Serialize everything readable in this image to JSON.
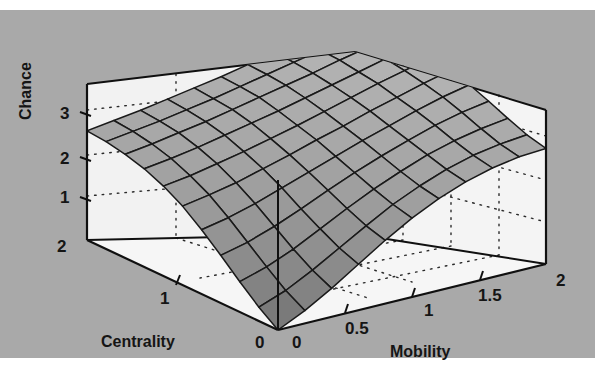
{
  "figure": {
    "background_color": "#a9a9a9",
    "page_color": "#ffffff",
    "line_color": "#151515",
    "surface_fill_light": "#b4b4b4",
    "surface_fill_dark": "#6e6e6e",
    "wall_color": "#f2f2f2"
  },
  "chart_data": {
    "type": "surface",
    "title": "",
    "xlabel": "Mobility",
    "ylabel": "Centrality",
    "zlabel": "Chance",
    "grid": true,
    "legend": null,
    "xlim": [
      0,
      2
    ],
    "ylim": [
      0,
      2
    ],
    "zlim": [
      0,
      3.4
    ],
    "xticks": [
      "0",
      "0.5",
      "1",
      "1.5",
      "2"
    ],
    "xtick_values": [
      0,
      0.5,
      1,
      1.5,
      2
    ],
    "yticks": [
      "0",
      "1",
      "2"
    ],
    "ytick_values": [
      0,
      1,
      2
    ],
    "zticks": [
      "1",
      "2",
      "3"
    ],
    "ztick_values": [
      1,
      2,
      3
    ],
    "x": [
      0,
      0.2,
      0.4,
      0.6,
      0.8,
      1.0,
      1.2,
      1.4,
      1.6,
      1.8,
      2.0
    ],
    "y": [
      0,
      0.2,
      0.4,
      0.6,
      0.8,
      1.0,
      1.2,
      1.4,
      1.6,
      1.8,
      2.0
    ],
    "z": [
      [
        0.0,
        0.28,
        0.62,
        1.0,
        1.38,
        1.72,
        2.0,
        2.22,
        2.38,
        2.48,
        2.52
      ],
      [
        0.3,
        0.52,
        0.82,
        1.16,
        1.5,
        1.82,
        2.08,
        2.3,
        2.46,
        2.56,
        2.62
      ],
      [
        0.66,
        0.84,
        1.08,
        1.38,
        1.68,
        1.96,
        2.2,
        2.42,
        2.58,
        2.7,
        2.78
      ],
      [
        1.04,
        1.18,
        1.38,
        1.62,
        1.88,
        2.12,
        2.34,
        2.54,
        2.72,
        2.86,
        2.96
      ],
      [
        1.4,
        1.52,
        1.68,
        1.88,
        2.08,
        2.28,
        2.48,
        2.66,
        2.84,
        3.0,
        3.12
      ],
      [
        1.72,
        1.82,
        1.94,
        2.1,
        2.26,
        2.44,
        2.6,
        2.78,
        2.94,
        3.1,
        3.24
      ],
      [
        1.96,
        2.04,
        2.16,
        2.28,
        2.42,
        2.56,
        2.72,
        2.88,
        3.04,
        3.18,
        3.32
      ],
      [
        2.14,
        2.22,
        2.32,
        2.44,
        2.56,
        2.68,
        2.82,
        2.96,
        3.1,
        3.24,
        3.36
      ],
      [
        2.26,
        2.34,
        2.44,
        2.54,
        2.66,
        2.78,
        2.9,
        3.02,
        3.16,
        3.28,
        3.38
      ],
      [
        2.34,
        2.42,
        2.5,
        2.6,
        2.7,
        2.82,
        2.94,
        3.06,
        3.18,
        3.3,
        3.4
      ],
      [
        2.38,
        2.46,
        2.54,
        2.64,
        2.74,
        2.84,
        2.96,
        3.08,
        3.2,
        3.32,
        3.4
      ]
    ]
  },
  "axes": {
    "z": {
      "title": "Chance",
      "ticks": [
        "3",
        "2",
        "1"
      ]
    },
    "y": {
      "title": "Centrality",
      "ticks": [
        "2",
        "1",
        "0"
      ]
    },
    "x": {
      "title": "Mobility",
      "ticks": [
        "0",
        "0.5",
        "1",
        "1.5",
        "2"
      ]
    }
  }
}
